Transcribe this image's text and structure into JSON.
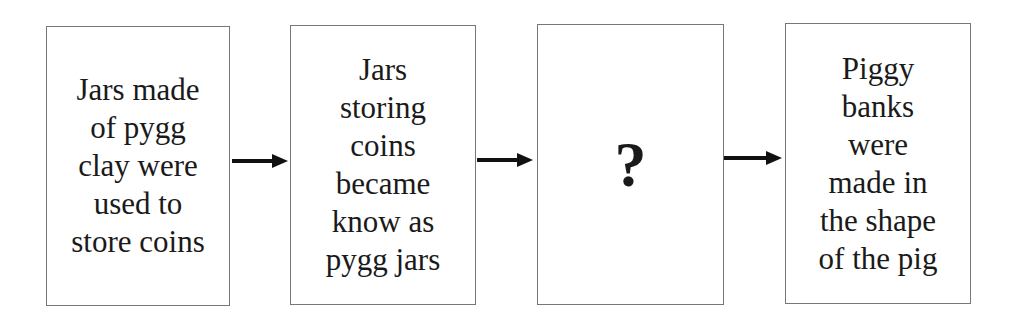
{
  "diagram": {
    "type": "flowchart",
    "direction": "left-to-right",
    "boxes": [
      {
        "id": "step-1",
        "text": "Jars made\nof pygg\nclay were\nused to\nstore coins"
      },
      {
        "id": "step-2",
        "text": "Jars\nstoring\ncoins\nbecame\nknow as\npygg jars"
      },
      {
        "id": "step-3",
        "text": "?"
      },
      {
        "id": "step-4",
        "text": "Piggy\nbanks\nwere\nmade in\nthe shape\nof the pig"
      }
    ],
    "arrows": [
      {
        "from": "step-1",
        "to": "step-2"
      },
      {
        "from": "step-2",
        "to": "step-3"
      },
      {
        "from": "step-3",
        "to": "step-4"
      }
    ]
  }
}
